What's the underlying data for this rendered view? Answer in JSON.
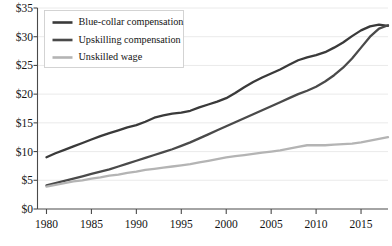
{
  "chart_data": {
    "type": "line",
    "title": "",
    "subtitle": "",
    "xlabel": "",
    "ylabel": "",
    "grid": true,
    "legend_position": "top-left",
    "xlim": [
      1979,
      2018
    ],
    "ylim": [
      0,
      35
    ],
    "y_ticks": [
      0,
      5,
      10,
      15,
      20,
      25,
      30,
      35
    ],
    "y_tick_labels": [
      "$0",
      "$5",
      "$10",
      "$15",
      "$20",
      "$25",
      "$30",
      "$35"
    ],
    "x_ticks": [
      1980,
      1985,
      1990,
      1995,
      2000,
      2005,
      2010,
      2015
    ],
    "x_tick_labels": [
      "1980",
      "1985",
      "1990",
      "1995",
      "2000",
      "2005",
      "2010",
      "2015"
    ],
    "x": [
      1980,
      1981,
      1982,
      1983,
      1984,
      1985,
      1986,
      1987,
      1988,
      1989,
      1990,
      1991,
      1992,
      1993,
      1994,
      1995,
      1996,
      1997,
      1998,
      1999,
      2000,
      2001,
      2002,
      2003,
      2004,
      2005,
      2006,
      2007,
      2008,
      2009,
      2010,
      2011,
      2012,
      2013,
      2014,
      2015,
      2016,
      2017,
      2018
    ],
    "series": [
      {
        "name": "Blue-collar compensation",
        "color": "#3a3a3a",
        "width": 2.3,
        "values": [
          9.0,
          9.7,
          10.3,
          10.9,
          11.5,
          12.1,
          12.7,
          13.2,
          13.7,
          14.2,
          14.6,
          15.2,
          15.9,
          16.3,
          16.6,
          16.8,
          17.1,
          17.7,
          18.2,
          18.7,
          19.3,
          20.2,
          21.2,
          22.1,
          22.9,
          23.6,
          24.3,
          25.1,
          25.9,
          26.4,
          26.8,
          27.3,
          28.1,
          29.0,
          30.1,
          31.1,
          31.8,
          32.1,
          31.9
        ]
      },
      {
        "name": "Upskilling compensation",
        "color": "#4a4a4a",
        "width": 2.3,
        "values": [
          4.1,
          4.5,
          4.9,
          5.3,
          5.7,
          6.1,
          6.5,
          6.9,
          7.4,
          7.9,
          8.4,
          8.9,
          9.4,
          9.9,
          10.4,
          11.0,
          11.6,
          12.3,
          13.0,
          13.7,
          14.4,
          15.1,
          15.8,
          16.5,
          17.2,
          17.9,
          18.6,
          19.3,
          20.0,
          20.6,
          21.3,
          22.2,
          23.3,
          24.6,
          26.2,
          28.1,
          30.0,
          31.4,
          32.0
        ]
      },
      {
        "name": "Unskilled wage",
        "color": "#b4b4b4",
        "width": 2.3,
        "values": [
          3.9,
          4.2,
          4.5,
          4.8,
          5.0,
          5.3,
          5.5,
          5.8,
          6.0,
          6.3,
          6.5,
          6.8,
          7.0,
          7.2,
          7.4,
          7.6,
          7.8,
          8.1,
          8.4,
          8.7,
          9.0,
          9.2,
          9.4,
          9.6,
          9.8,
          10.0,
          10.2,
          10.5,
          10.8,
          11.1,
          11.1,
          11.1,
          11.2,
          11.3,
          11.4,
          11.6,
          11.9,
          12.2,
          12.5
        ]
      }
    ],
    "legend": [
      {
        "label": "Blue-collar compensation",
        "color": "#3a3a3a"
      },
      {
        "label": "Upskilling compensation",
        "color": "#4a4a4a"
      },
      {
        "label": "Unskilled wage",
        "color": "#b4b4b4"
      }
    ]
  }
}
